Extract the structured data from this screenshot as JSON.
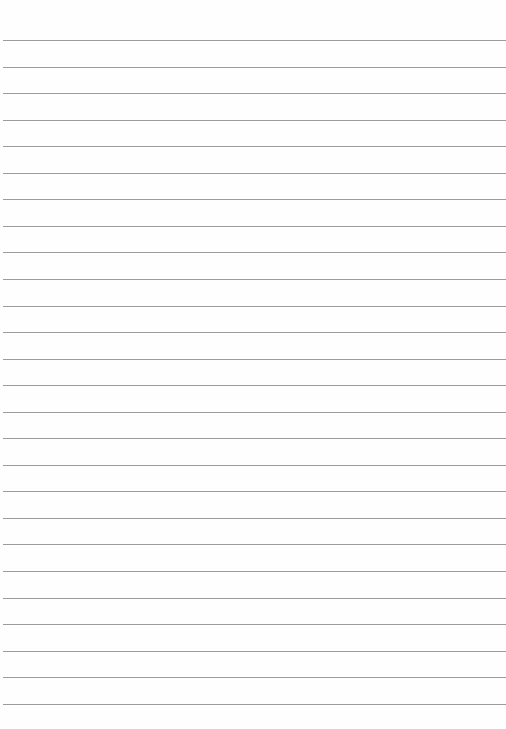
{
  "page": {
    "type": "lined-paper",
    "background": "#fefefe",
    "line_color": "#8a8a8a",
    "line_count": 26,
    "first_line_y": 40,
    "line_spacing": 26.55,
    "line_left": 3,
    "text": ""
  }
}
